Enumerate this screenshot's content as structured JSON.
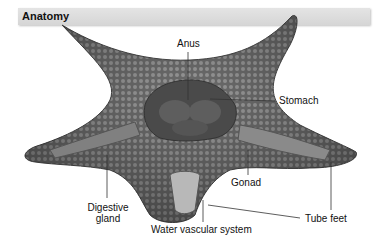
{
  "title": "Anatomy",
  "labels": {
    "anus": "Anus",
    "stomach": "Stomach",
    "gonad": "Gonad",
    "digestive_gland_1": "Digestive",
    "digestive_gland_2": "gland",
    "water_vascular": "Water vascular system",
    "tube_feet": "Tube feet"
  }
}
